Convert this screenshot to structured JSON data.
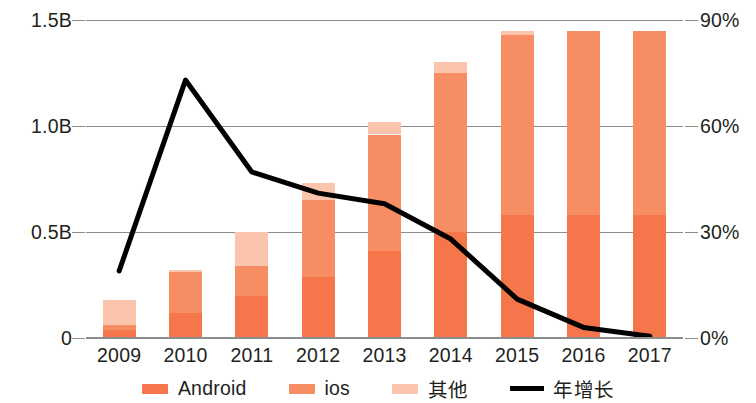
{
  "chart_data": {
    "type": "bar",
    "title": "",
    "subtitle": "",
    "xlabel": "",
    "ylabel": "",
    "y2label": "",
    "categories": [
      "2009",
      "2010",
      "2011",
      "2012",
      "2013",
      "2014",
      "2015",
      "2016",
      "2017"
    ],
    "yticks": [
      "0",
      "0.5B",
      "1.0B",
      "1.5B"
    ],
    "ytick_values": [
      0,
      0.5,
      1.0,
      1.5
    ],
    "ylim": [
      0,
      1.5
    ],
    "y2ticks": [
      "0%",
      "30%",
      "60%",
      "90%"
    ],
    "y2tick_values": [
      0,
      30,
      60,
      90
    ],
    "y2lim": [
      0,
      90
    ],
    "grid": true,
    "stacked": true,
    "legend_position": "bottom",
    "series": [
      {
        "name": "Android",
        "type": "bar",
        "color": "#f4764a",
        "values": [
          0.04,
          0.12,
          0.2,
          0.29,
          0.41,
          0.5,
          0.58,
          0.58,
          0.58
        ]
      },
      {
        "name": "ios",
        "type": "bar",
        "color": "#f78e63",
        "values": [
          0.02,
          0.19,
          0.14,
          0.36,
          0.55,
          0.75,
          0.85,
          0.87,
          0.87
        ]
      },
      {
        "name": "其他",
        "type": "bar",
        "color": "#fac4ad",
        "values": [
          0.12,
          0.01,
          0.16,
          0.08,
          0.06,
          0.05,
          0.02,
          0.0,
          0.0
        ]
      },
      {
        "name": "年增长",
        "type": "line",
        "axis": "y2",
        "color": "#000000",
        "values": [
          19,
          73,
          47,
          41,
          38,
          28,
          11,
          3,
          0.5
        ]
      }
    ],
    "stack_totals": [
      0.18,
      0.32,
      0.5,
      0.73,
      1.02,
      1.3,
      1.45,
      1.45,
      1.45
    ]
  },
  "legend": {
    "items": [
      {
        "label": "Android",
        "marker": "swatch",
        "color": "#f4764a"
      },
      {
        "label": "ios",
        "marker": "swatch",
        "color": "#f78e63"
      },
      {
        "label": "其他",
        "marker": "swatch",
        "color": "#fac4ad"
      },
      {
        "label": "年增长",
        "marker": "line",
        "color": "#000000"
      }
    ]
  }
}
